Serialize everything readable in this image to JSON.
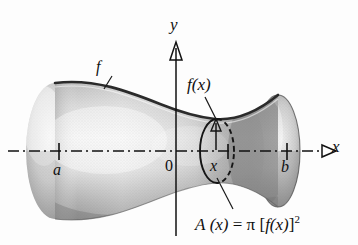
{
  "figure": {
    "type": "calculus-solid-of-revolution-diagram",
    "background_color": "#fdfdfd",
    "ink_color": "#101010",
    "solid_fill_light": "#f2f2f2",
    "solid_fill_mid": "#c9c9c9",
    "solid_fill_dark": "#8a8a8a",
    "axes": {
      "x_axis_label": "x",
      "y_axis_label": "y",
      "origin_label": "0",
      "x_axis_style": "dash-dot",
      "y_axis_style": "solid",
      "x_axis_arrow": true,
      "y_axis_arrow": true
    },
    "ticks": [
      {
        "name": "a",
        "label": "a",
        "x": 59
      },
      {
        "name": "origin",
        "label": "0",
        "x": 176
      },
      {
        "name": "x",
        "label": "x",
        "x": 228
      },
      {
        "name": "b",
        "label": "b",
        "x": 287
      }
    ],
    "curve_label": "f",
    "radius_label": "f(x)",
    "area_formula": {
      "lhs": "A",
      "lhs_arg": "(x)",
      "equals": "=",
      "pi": "π",
      "bracket_open": "[",
      "fx": "f(x)",
      "bracket_close": "]",
      "exponent": "2",
      "full": "A (x) = π [f(x)] 2"
    },
    "cross_section": {
      "shape": "ellipse",
      "center_x": 217,
      "center_y": 151,
      "rx": 17,
      "ry": 32,
      "front_half": "solid",
      "back_half": "dashed",
      "radius_arrow": true
    }
  }
}
